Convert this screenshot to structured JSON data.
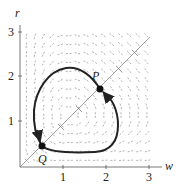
{
  "diagram": {
    "type": "phase-plane",
    "axes": {
      "x_label": "w",
      "y_label": "r",
      "x_ticks": [
        "1",
        "2",
        "3"
      ],
      "y_ticks": [
        "1",
        "2",
        "3"
      ],
      "x_range": [
        0,
        3.2
      ],
      "y_range": [
        0,
        3.2
      ]
    },
    "points": [
      {
        "label": "P",
        "w": 1.85,
        "r": 1.75
      },
      {
        "label": "Q",
        "w": 0.5,
        "r": 0.45
      }
    ],
    "diagonal_line": "r = w",
    "closed_orbit": "clockwise loop through P and Q",
    "colors": {
      "curve": "#222222",
      "field": "#9a9a9a",
      "axis": "#555555"
    }
  }
}
